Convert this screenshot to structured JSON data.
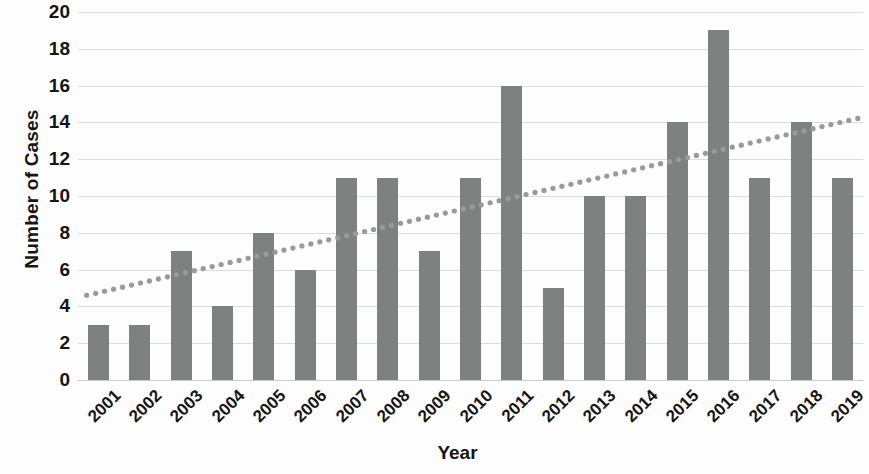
{
  "chart_data": {
    "type": "bar",
    "title": "",
    "xlabel": "Year",
    "ylabel": "Number of Cases",
    "categories": [
      "2001",
      "2002",
      "2003",
      "2004",
      "2005",
      "2006",
      "2007",
      "2008",
      "2009",
      "2010",
      "2011",
      "2012",
      "2013",
      "2014",
      "2015",
      "2016",
      "2017",
      "2018",
      "2019"
    ],
    "values": [
      3,
      3,
      7,
      4,
      8,
      6,
      11,
      11,
      7,
      11,
      16,
      5,
      10,
      10,
      14,
      19,
      11,
      14,
      11
    ],
    "series": [
      {
        "name": "Number of Cases",
        "values": [
          3,
          3,
          7,
          4,
          8,
          6,
          11,
          11,
          7,
          11,
          16,
          5,
          10,
          10,
          14,
          19,
          11,
          14,
          11
        ]
      }
    ],
    "ylim": [
      0,
      20
    ],
    "y_ticks": [
      0,
      2,
      4,
      6,
      8,
      10,
      12,
      14,
      16,
      18,
      20
    ],
    "grid": true,
    "legend": "none",
    "bar_color": "#7f8080",
    "gridline_color": "#dadde0",
    "trendline": {
      "type": "linear",
      "style": "dotted",
      "color": "#9a9a9a",
      "start_value": 4.6,
      "end_value": 14.3
    }
  },
  "axes": {
    "y_title": "Number of Cases",
    "x_title": "Year",
    "y_tick_labels": [
      "0",
      "2",
      "4",
      "6",
      "8",
      "10",
      "12",
      "14",
      "16",
      "18",
      "20"
    ],
    "x_tick_labels": [
      "2001",
      "2002",
      "2003",
      "2004",
      "2005",
      "2006",
      "2007",
      "2008",
      "2009",
      "2010",
      "2011",
      "2012",
      "2013",
      "2014",
      "2015",
      "2016",
      "2017",
      "2018",
      "2019"
    ]
  }
}
